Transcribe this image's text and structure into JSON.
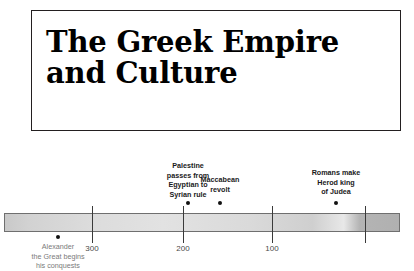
{
  "title": {
    "heading": "The Greek Empire and Culture"
  },
  "timeline": {
    "axis_ticks": [
      {
        "label": "300",
        "x": 92
      },
      {
        "label": "200",
        "x": 183
      },
      {
        "label": "100",
        "x": 272
      },
      {
        "label": "",
        "x": 365
      }
    ],
    "events_above": [
      {
        "label": "Palestine\npasses from\nEgyptian to\nSyrian rule",
        "x": 188,
        "label_top": 21,
        "dot_top": 61
      },
      {
        "label": "Maccabean\nrevolt",
        "x": 220,
        "label_top": 35,
        "dot_top": 61
      },
      {
        "label": "Romans make\nHerod king\nof Judea",
        "x": 336,
        "label_top": 28,
        "dot_top": 61
      }
    ],
    "events_below": [
      {
        "label": "Alexander\nthe Great begins\nhis conquests",
        "x": 58,
        "dot_top": 95,
        "label_top": 102
      }
    ]
  }
}
